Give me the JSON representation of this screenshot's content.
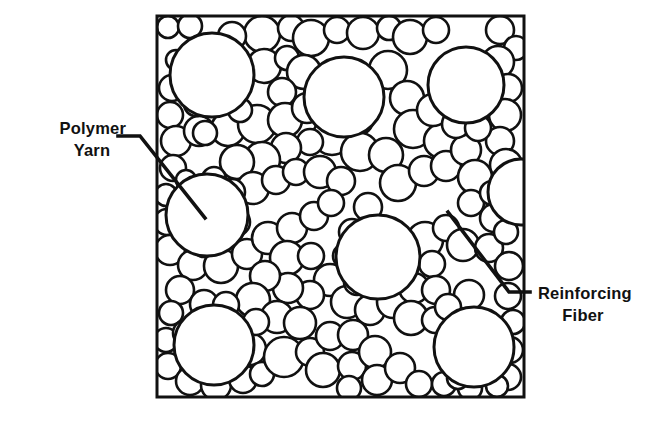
{
  "figure": {
    "type": "cross-section-diagram",
    "background_color": "#ffffff",
    "line_color": "#111111"
  },
  "frame": {
    "name": "specimen-boundary-box",
    "x": 157,
    "y": 16,
    "width": 367,
    "height": 381,
    "stroke_width": 3
  },
  "labels": [
    {
      "id": "polymer-yarn",
      "lines": [
        "Polymer",
        "Yarn"
      ],
      "text_anchor": "end",
      "text_x": 126,
      "line1_y": 134,
      "line2_y": 156,
      "leader": "M 118 136 L 140 136 L 205 218",
      "leader_width": 3.6
    },
    {
      "id": "reinforcing-fiber",
      "lines": [
        "Reinforcing",
        "Fiber"
      ],
      "text_anchor": "start",
      "text_x": 538,
      "line1_y": 299,
      "line2_y": 321,
      "leader": "M 448 212 L 509 292 L 530 292",
      "leader_width": 3.6
    }
  ],
  "chart_data": {
    "type": "scatter",
    "title": "",
    "xlabel": "",
    "ylabel": "",
    "xlim": [
      157,
      524
    ],
    "ylim": [
      16,
      397
    ],
    "grid": false,
    "legend": [
      "Polymer Yarn",
      "Reinforcing Fiber"
    ],
    "series": [
      {
        "name": "Polymer Yarn",
        "note": "large circles, radius ~38-43 px",
        "circles": [
          [
            212,
            75,
            42
          ],
          [
            344,
            97,
            40
          ],
          [
            466,
            85,
            38
          ],
          [
            207,
            215,
            41
          ],
          [
            378,
            257,
            42
          ],
          [
            214,
            345,
            40
          ],
          [
            474,
            347,
            40
          ],
          [
            521,
            192,
            33
          ]
        ]
      },
      {
        "name": "Reinforcing Fiber",
        "note": "small circles, radius ~8-22 px, densely packed",
        "circles": [
          [
            168,
            27,
            11
          ],
          [
            190,
            26,
            12
          ],
          [
            262,
            34,
            18
          ],
          [
            291,
            28,
            13
          ],
          [
            311,
            38,
            18
          ],
          [
            337,
            30,
            13
          ],
          [
            363,
            33,
            16
          ],
          [
            389,
            28,
            12
          ],
          [
            410,
            37,
            17
          ],
          [
            436,
            30,
            13
          ],
          [
            500,
            30,
            14
          ],
          [
            516,
            48,
            12
          ],
          [
            264,
            66,
            17
          ],
          [
            287,
            58,
            12
          ],
          [
            304,
            72,
            17
          ],
          [
            282,
            92,
            14
          ],
          [
            388,
            70,
            19
          ],
          [
            407,
            98,
            17
          ],
          [
            413,
            129,
            19
          ],
          [
            441,
            141,
            17
          ],
          [
            498,
            62,
            16
          ],
          [
            508,
            88,
            14
          ],
          [
            505,
            115,
            16
          ],
          [
            500,
            141,
            14
          ],
          [
            506,
            165,
            16
          ],
          [
            176,
            60,
            10
          ],
          [
            172,
            88,
            13
          ],
          [
            170,
            115,
            13
          ],
          [
            176,
            141,
            15
          ],
          [
            199,
            131,
            15
          ],
          [
            228,
            129,
            17
          ],
          [
            257,
            124,
            19
          ],
          [
            285,
            120,
            17
          ],
          [
            307,
            108,
            15
          ],
          [
            332,
            136,
            19
          ],
          [
            358,
            120,
            15
          ],
          [
            360,
            152,
            19
          ],
          [
            386,
            155,
            17
          ],
          [
            310,
            142,
            13
          ],
          [
            286,
            148,
            15
          ],
          [
            262,
            160,
            18
          ],
          [
            237,
            162,
            17
          ],
          [
            253,
            188,
            16
          ],
          [
            276,
            180,
            14
          ],
          [
            296,
            172,
            13
          ],
          [
            320,
            172,
            16
          ],
          [
            341,
            181,
            14
          ],
          [
            398,
            183,
            18
          ],
          [
            424,
            171,
            15
          ],
          [
            446,
            166,
            15
          ],
          [
            466,
            150,
            15
          ],
          [
            475,
            177,
            17
          ],
          [
            471,
            203,
            13
          ],
          [
            492,
            193,
            12
          ],
          [
            494,
            218,
            14
          ],
          [
            173,
            168,
            13
          ],
          [
            166,
            195,
            11
          ],
          [
            167,
            222,
            13
          ],
          [
            170,
            250,
            15
          ],
          [
            193,
            265,
            15
          ],
          [
            221,
            266,
            17
          ],
          [
            247,
            254,
            15
          ],
          [
            268,
            238,
            16
          ],
          [
            292,
            228,
            15
          ],
          [
            314,
            216,
            14
          ],
          [
            331,
            203,
            13
          ],
          [
            287,
            258,
            17
          ],
          [
            311,
            256,
            13
          ],
          [
            330,
            280,
            16
          ],
          [
            310,
            295,
            14
          ],
          [
            288,
            288,
            15
          ],
          [
            265,
            276,
            15
          ],
          [
            253,
            300,
            17
          ],
          [
            277,
            317,
            16
          ],
          [
            300,
            323,
            16
          ],
          [
            347,
            302,
            16
          ],
          [
            370,
            310,
            15
          ],
          [
            393,
            302,
            16
          ],
          [
            414,
            288,
            15
          ],
          [
            425,
            240,
            18
          ],
          [
            446,
            228,
            13
          ],
          [
            463,
            245,
            16
          ],
          [
            489,
            248,
            14
          ],
          [
            506,
            232,
            12
          ],
          [
            509,
            266,
            14
          ],
          [
            432,
            264,
            13
          ],
          [
            436,
            290,
            14
          ],
          [
            411,
            318,
            17
          ],
          [
            435,
            320,
            13
          ],
          [
            508,
            296,
            13
          ],
          [
            513,
            322,
            12
          ],
          [
            510,
            350,
            13
          ],
          [
            508,
            377,
            13
          ],
          [
            180,
            290,
            14
          ],
          [
            171,
            313,
            12
          ],
          [
            166,
            340,
            12
          ],
          [
            168,
            366,
            13
          ],
          [
            190,
            381,
            14
          ],
          [
            216,
            385,
            15
          ],
          [
            243,
            379,
            14
          ],
          [
            250,
            349,
            16
          ],
          [
            256,
            322,
            13
          ],
          [
            262,
            374,
            12
          ],
          [
            284,
            357,
            20
          ],
          [
            310,
            352,
            14
          ],
          [
            330,
            336,
            14
          ],
          [
            353,
            335,
            15
          ],
          [
            323,
            370,
            17
          ],
          [
            352,
            366,
            14
          ],
          [
            375,
            352,
            16
          ],
          [
            377,
            380,
            15
          ],
          [
            349,
            388,
            12
          ],
          [
            400,
            368,
            15
          ],
          [
            419,
            384,
            13
          ],
          [
            444,
            384,
            12
          ],
          [
            470,
            388,
            12
          ],
          [
            497,
            386,
            11
          ],
          [
            433,
            110,
            16
          ],
          [
            456,
            124,
            14
          ],
          [
            478,
            128,
            13
          ],
          [
            196,
            104,
            12
          ],
          [
            222,
            100,
            13
          ],
          [
            240,
            110,
            12
          ],
          [
            232,
            36,
            14
          ],
          [
            205,
            133,
            12
          ],
          [
            186,
            180,
            10
          ],
          [
            188,
            205,
            11
          ],
          [
            186,
            232,
            12
          ],
          [
            204,
            246,
            11
          ],
          [
            236,
            222,
            14
          ],
          [
            232,
            192,
            13
          ],
          [
            214,
            179,
            12
          ],
          [
            368,
            207,
            14
          ],
          [
            352,
            232,
            13
          ],
          [
            345,
            256,
            12
          ],
          [
            357,
            282,
            13
          ],
          [
            204,
            304,
            14
          ],
          [
            186,
            333,
            13
          ],
          [
            190,
            357,
            12
          ],
          [
            226,
            305,
            13
          ],
          [
            469,
            295,
            15
          ],
          [
            448,
            307,
            13
          ],
          [
            458,
            378,
            11
          ],
          [
            485,
            371,
            10
          ]
        ]
      }
    ]
  }
}
